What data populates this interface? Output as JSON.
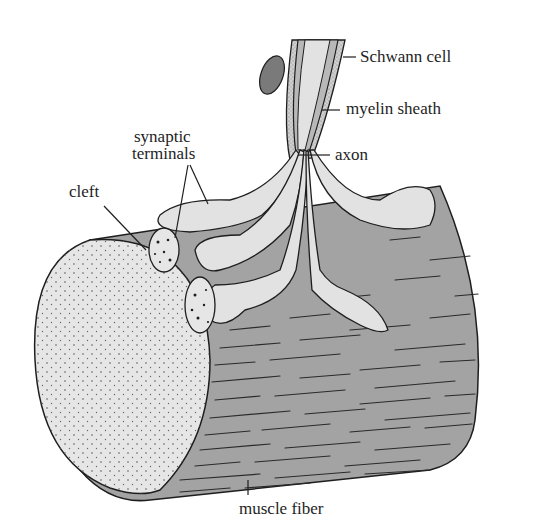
{
  "figure": {
    "labels": {
      "schwann_cell": "Schwann cell",
      "myelin_sheath": "myelin sheath",
      "axon": "axon",
      "synaptic_terminals_line1": "synaptic",
      "synaptic_terminals_line2": "terminals",
      "cleft": "cleft",
      "muscle_fiber": "muscle fiber"
    },
    "colors": {
      "background": "#ffffff",
      "muscle_fill": "#a3a3a3",
      "muscle_cross_section": "#e6e6e6",
      "terminal_fill": "#e2e2e2",
      "myelin_fill": "#b8b8b8",
      "schwann_fill": "#cfcfcf",
      "outline": "#1e1e1e"
    }
  }
}
